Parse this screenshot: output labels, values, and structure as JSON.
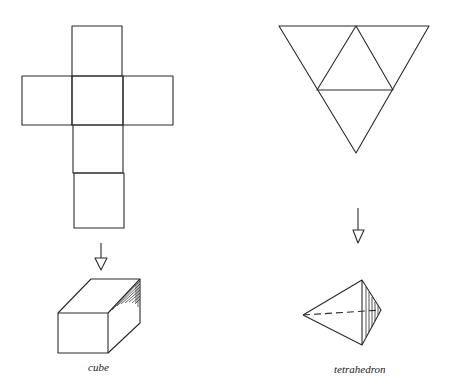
{
  "figure": {
    "left": {
      "net_name": "cube net",
      "solid_label": "cube"
    },
    "right": {
      "net_name": "tetrahedron net",
      "solid_label": "tetrahedron"
    },
    "stroke_color": "#2a2a2a",
    "background": "#ffffff"
  }
}
